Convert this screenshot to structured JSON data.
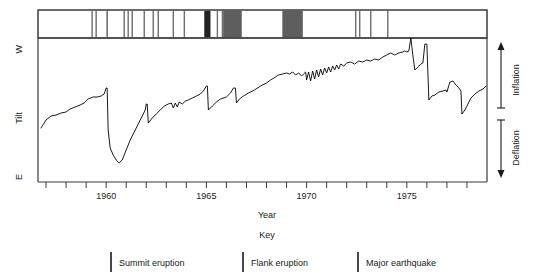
{
  "chart_data": {
    "type": "line",
    "title": "",
    "xlabel": "Year",
    "ylabel": "Tilt",
    "xlim": [
      1956.6,
      1979.0
    ],
    "xticks": [
      1957,
      1958,
      1959,
      1960,
      1961,
      1962,
      1963,
      1964,
      1965,
      1966,
      1967,
      1968,
      1969,
      1970,
      1971,
      1972,
      1973,
      1974,
      1975,
      1976,
      1977,
      1978
    ],
    "xticklabels_shown": [
      "1960",
      "1965",
      "1970",
      "1975"
    ],
    "xticklabel_years": [
      1960,
      1965,
      1970,
      1975
    ],
    "y_axis_top_label": "W",
    "y_axis_bottom_label": "E",
    "grid": false,
    "legend_position": "below-plot",
    "right_annotations": [
      {
        "label": "Inflation",
        "direction": "up"
      },
      {
        "label": "Deflation",
        "direction": "down"
      }
    ],
    "series": [
      {
        "name": "Tilt",
        "color": "#000000",
        "points_xy": [
          [
            1956.75,
            128
          ],
          [
            1957.0,
            120
          ],
          [
            1957.25,
            116
          ],
          [
            1957.5,
            115
          ],
          [
            1957.75,
            113
          ],
          [
            1958.0,
            112
          ],
          [
            1958.2,
            109
          ],
          [
            1958.45,
            107
          ],
          [
            1958.7,
            105
          ],
          [
            1958.9,
            103
          ],
          [
            1959.1,
            99
          ],
          [
            1959.35,
            97
          ],
          [
            1959.55,
            97
          ],
          [
            1959.75,
            96
          ],
          [
            1959.9,
            94
          ],
          [
            1960.0,
            88
          ],
          [
            1960.05,
            88
          ],
          [
            1960.1,
            130
          ],
          [
            1960.2,
            148
          ],
          [
            1960.35,
            155
          ],
          [
            1960.5,
            160
          ],
          [
            1960.65,
            163
          ],
          [
            1960.8,
            160
          ],
          [
            1961.0,
            150
          ],
          [
            1961.2,
            140
          ],
          [
            1961.45,
            130
          ],
          [
            1961.65,
            122
          ],
          [
            1961.8,
            116
          ],
          [
            1961.95,
            110
          ],
          [
            1962.0,
            104
          ],
          [
            1962.05,
            104
          ],
          [
            1962.1,
            123
          ],
          [
            1962.3,
            118
          ],
          [
            1962.5,
            114
          ],
          [
            1962.7,
            110
          ],
          [
            1962.9,
            106
          ],
          [
            1963.1,
            104
          ],
          [
            1963.25,
            103
          ],
          [
            1963.35,
            108
          ],
          [
            1963.45,
            103
          ],
          [
            1963.55,
            107
          ],
          [
            1963.65,
            102
          ],
          [
            1963.8,
            104
          ],
          [
            1963.95,
            101
          ],
          [
            1964.1,
            100
          ],
          [
            1964.3,
            98
          ],
          [
            1964.5,
            96
          ],
          [
            1964.7,
            94
          ],
          [
            1964.85,
            91
          ],
          [
            1965.0,
            86
          ],
          [
            1965.05,
            86
          ],
          [
            1965.1,
            110
          ],
          [
            1965.3,
            106
          ],
          [
            1965.5,
            102
          ],
          [
            1965.7,
            99
          ],
          [
            1966.0,
            97
          ],
          [
            1966.2,
            93
          ],
          [
            1966.35,
            88
          ],
          [
            1966.45,
            88
          ],
          [
            1966.5,
            103
          ],
          [
            1966.65,
            99
          ],
          [
            1966.85,
            96
          ],
          [
            1967.1,
            93
          ],
          [
            1967.4,
            90
          ],
          [
            1967.7,
            86
          ],
          [
            1968.0,
            83
          ],
          [
            1968.2,
            80
          ],
          [
            1968.45,
            77
          ],
          [
            1968.6,
            75
          ],
          [
            1968.8,
            74
          ],
          [
            1969.0,
            73
          ],
          [
            1969.15,
            74
          ],
          [
            1969.3,
            72
          ],
          [
            1969.45,
            75
          ],
          [
            1969.6,
            73
          ],
          [
            1969.75,
            76
          ],
          [
            1969.85,
            74
          ],
          [
            1969.95,
            72
          ],
          [
            1970.0,
            80
          ],
          [
            1970.1,
            72
          ],
          [
            1970.2,
            81
          ],
          [
            1970.3,
            71
          ],
          [
            1970.4,
            79
          ],
          [
            1970.5,
            70
          ],
          [
            1970.6,
            77
          ],
          [
            1970.7,
            69
          ],
          [
            1970.8,
            75
          ],
          [
            1970.9,
            68
          ],
          [
            1971.0,
            73
          ],
          [
            1971.1,
            67
          ],
          [
            1971.2,
            72
          ],
          [
            1971.3,
            66
          ],
          [
            1971.4,
            70
          ],
          [
            1971.5,
            65
          ],
          [
            1971.6,
            69
          ],
          [
            1971.7,
            64
          ],
          [
            1971.85,
            66
          ],
          [
            1972.0,
            63
          ],
          [
            1972.2,
            62
          ],
          [
            1972.4,
            64
          ],
          [
            1972.6,
            61
          ],
          [
            1972.8,
            62
          ],
          [
            1973.0,
            60
          ],
          [
            1973.2,
            61
          ],
          [
            1973.4,
            59
          ],
          [
            1973.6,
            60
          ],
          [
            1973.8,
            57
          ],
          [
            1974.0,
            55
          ],
          [
            1974.2,
            53
          ],
          [
            1974.4,
            55
          ],
          [
            1974.6,
            53
          ],
          [
            1974.8,
            52
          ],
          [
            1974.9,
            51
          ],
          [
            1975.0,
            52
          ],
          [
            1975.1,
            51
          ],
          [
            1975.2,
            38
          ],
          [
            1975.3,
            55
          ],
          [
            1975.4,
            70
          ],
          [
            1975.5,
            68
          ],
          [
            1975.6,
            66
          ],
          [
            1975.7,
            64
          ],
          [
            1975.8,
            63
          ],
          [
            1975.9,
            44
          ],
          [
            1976.0,
            44
          ],
          [
            1976.1,
            100
          ],
          [
            1976.25,
            96
          ],
          [
            1976.4,
            95
          ],
          [
            1976.6,
            92
          ],
          [
            1976.8,
            91
          ],
          [
            1976.95,
            90
          ],
          [
            1977.0,
            92
          ],
          [
            1977.15,
            82
          ],
          [
            1977.3,
            81
          ],
          [
            1977.45,
            85
          ],
          [
            1977.6,
            88
          ],
          [
            1977.7,
            91
          ],
          [
            1977.75,
            114
          ],
          [
            1977.9,
            110
          ],
          [
            1978.05,
            104
          ],
          [
            1978.2,
            98
          ],
          [
            1978.4,
            94
          ],
          [
            1978.6,
            91
          ],
          [
            1978.8,
            89
          ],
          [
            1978.95,
            86
          ]
        ]
      }
    ],
    "event_bar": {
      "description": "Event timeline bar above plot showing eruptions and earthquakes",
      "events": [
        {
          "year": 1959.3,
          "type": "summit-eruption",
          "width": 1.0
        },
        {
          "year": 1959.5,
          "type": "summit-eruption",
          "width": 1.0
        },
        {
          "year": 1960.05,
          "type": "flank-eruption",
          "width": 1.0
        },
        {
          "year": 1960.9,
          "type": "summit-eruption",
          "width": 1.0
        },
        {
          "year": 1961.1,
          "type": "summit-eruption",
          "width": 1.0
        },
        {
          "year": 1961.3,
          "type": "summit-eruption",
          "width": 1.0
        },
        {
          "year": 1961.9,
          "type": "summit-eruption",
          "width": 1.0
        },
        {
          "year": 1962.35,
          "type": "summit-eruption",
          "width": 1.0
        },
        {
          "year": 1962.6,
          "type": "summit-eruption",
          "width": 1.0
        },
        {
          "year": 1963.35,
          "type": "summit-eruption",
          "width": 1.0
        },
        {
          "year": 1963.9,
          "type": "summit-eruption",
          "width": 1.0
        },
        {
          "year": 1965.05,
          "type": "major-earthquake",
          "width": 10.0
        },
        {
          "year": 1965.55,
          "type": "summit-eruption",
          "width": 1.0
        },
        {
          "year": 1965.8,
          "type": "summit-eruption",
          "width": 1.0
        },
        {
          "year": 1966.05,
          "type": "summit-eruption",
          "width": 1.0
        },
        {
          "year": 1966.3,
          "type": "flank-eruption",
          "width": 30.0
        },
        {
          "year": 1969.3,
          "type": "flank-eruption",
          "width": 33.0
        },
        {
          "year": 1972.45,
          "type": "summit-eruption",
          "width": 1.0
        },
        {
          "year": 1972.65,
          "type": "summit-eruption",
          "width": 1.0
        },
        {
          "year": 1973.2,
          "type": "summit-eruption",
          "width": 1.0
        },
        {
          "year": 1974.05,
          "type": "summit-eruption",
          "width": 1.0
        }
      ]
    }
  },
  "labels": {
    "y_top": "W",
    "y_bottom": "E",
    "y_axis_title": "Tilt",
    "x_axis_title": "Year",
    "inflation": "Inflation",
    "deflation": "Deflation"
  },
  "key": {
    "title": "Key",
    "items": [
      {
        "label": "Summit eruption",
        "swatch": "summit-eruption"
      },
      {
        "label": "Flank eruption",
        "swatch": "flank-eruption"
      },
      {
        "label": "Major earthquake",
        "swatch": "major-earthquake"
      }
    ]
  },
  "ticks": {
    "labels": [
      "1960",
      "1965",
      "1970",
      "1975"
    ]
  },
  "colors": {
    "line": "#1a1a1a",
    "axis": "#3a3a3a",
    "summit_eruption": "#6e6e6e",
    "flank_eruption": "#5e5e5e",
    "major_earthquake": "#222222",
    "background": "#ffffff"
  }
}
